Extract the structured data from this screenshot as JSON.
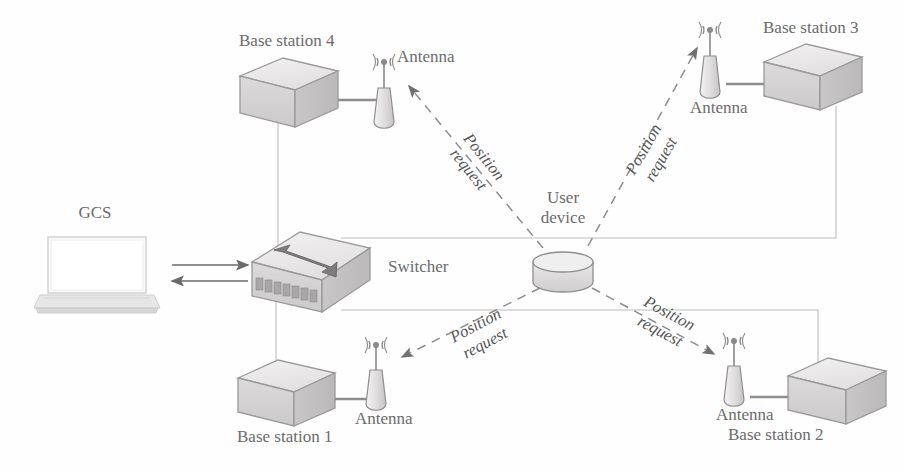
{
  "diagram": {
    "background_color": "#fefefe",
    "line_color": "#8a8a8a",
    "thin_link_color": "#b4b4b4",
    "text_color": "#6b6b6b",
    "box_face_light": "#eceaea",
    "box_face_mid": "#d9d7d7",
    "box_face_dark": "#c2c0c0"
  },
  "nodes": {
    "gcs": {
      "label": "GCS",
      "icon": "laptop-icon",
      "x": 95,
      "y": 212
    },
    "switcher": {
      "label": "Switcher",
      "icon": "switch-box-icon",
      "x": 310,
      "y": 268
    },
    "user_device": {
      "label_line1": "User",
      "label_line2": "device",
      "icon": "cylinder-puck-icon",
      "x": 563,
      "y": 268
    },
    "base_stations": [
      {
        "id": "base-station-4",
        "label": "Base station 4",
        "antenna_label": "Antenna",
        "icon": "server-box-icon",
        "antenna_icon": "antenna-icon"
      },
      {
        "id": "base-station-3",
        "label": "Base station 3",
        "antenna_label": "Antenna",
        "icon": "server-box-icon",
        "antenna_icon": "antenna-icon"
      },
      {
        "id": "base-station-1",
        "label": "Base station 1",
        "antenna_label": "Antenna",
        "icon": "server-box-icon",
        "antenna_icon": "antenna-icon"
      },
      {
        "id": "base-station-2",
        "label": "Base station 2",
        "antenna_label": "Antenna",
        "icon": "server-box-icon",
        "antenna_icon": "antenna-icon"
      }
    ]
  },
  "flows": {
    "position_requests": [
      {
        "id": "position-request-to-bs4",
        "line1": "Position",
        "line2": "request",
        "direction": "up-left"
      },
      {
        "id": "position-request-to-bs3",
        "line1": "Position",
        "line2": "request",
        "direction": "up-right"
      },
      {
        "id": "position-request-to-bs1",
        "line1": "Position",
        "line2": "request",
        "direction": "down-left"
      },
      {
        "id": "position-request-to-bs2",
        "line1": "Position",
        "line2": "request",
        "direction": "down-right"
      }
    ],
    "gcs_switcher": {
      "id": "gcs-switcher-duplex",
      "style": "solid-double-arrow",
      "label": ""
    }
  }
}
